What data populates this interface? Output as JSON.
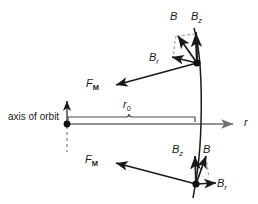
{
  "figure": {
    "type": "physics-vector-diagram",
    "background_color": "#ffffff",
    "stroke_color": "#1a1a1a",
    "dashed_color": "#8a8a8a",
    "axis_color": "#6f6f6f"
  },
  "labels": {
    "axis_of_orbit": "axis of orbit",
    "r_axis": "r",
    "r_zero_main": "r",
    "r_zero_sub": "0",
    "top_B": "B",
    "top_Bz_main": "B",
    "top_Bz_sub": "z",
    "top_Br_main": "B",
    "top_Br_sub": "r",
    "top_FM_main": "F",
    "top_FM_sub": "M",
    "bottom_B": "B",
    "bottom_Bz_main": "B",
    "bottom_Bz_sub": "z",
    "bottom_Br_main": "B",
    "bottom_Br_sub": "r",
    "bottom_FM_main": "F",
    "bottom_FM_sub": "M"
  },
  "geometry": {
    "origin_point": {
      "x": 67,
      "y": 124
    },
    "top_point": {
      "x": 197,
      "y": 63
    },
    "bottom_point": {
      "x": 196,
      "y": 184
    },
    "axis_crossing": {
      "x": 200,
      "y": 124
    },
    "r_axis_end": {
      "x": 240,
      "y": 124
    },
    "r0_brace_left": 68,
    "r0_brace_right": 196,
    "r0_brace_y": 118,
    "top_vectors": {
      "B": {
        "to_x": 177,
        "to_y": 34
      },
      "Bz": {
        "to_x": 196,
        "to_y": 32
      },
      "Br": {
        "to_x": 171,
        "to_y": 57
      },
      "FM": {
        "to_x": 114,
        "to_y": 86
      }
    },
    "bottom_vectors": {
      "B": {
        "to_x": 207,
        "to_y": 155
      },
      "Bz": {
        "to_x": 195,
        "to_y": 155
      },
      "Br": {
        "to_x": 217,
        "to_y": 183
      },
      "FM": {
        "to_x": 114,
        "to_y": 163
      }
    }
  }
}
